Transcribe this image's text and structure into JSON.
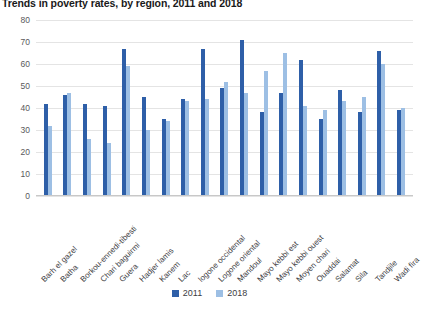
{
  "chart_data": {
    "type": "bar",
    "title": "Trends in poverty rates, by region, 2011 and 2018",
    "xlabel": "",
    "ylabel": "Percent",
    "ylim": [
      0,
      80
    ],
    "ytick_step": 10,
    "yticks": [
      "80",
      "70",
      "60",
      "50",
      "40",
      "30",
      "20",
      "10",
      "0"
    ],
    "grid": true,
    "legend_position": "bottom",
    "categories": [
      "Barh el gazel",
      "Batha",
      "Borkou-ennedi-tibesti",
      "Chari baguirmi",
      "Guera",
      "Hadjer lamis",
      "Kanem",
      "Lac",
      "logone occidental",
      "Logone oriental",
      "Mandoul",
      "Mayo kebbi est",
      "Mayo kebbi ouest",
      "Moyen chari",
      "Ouaddai",
      "Salamat",
      "Sila",
      "Tandjile",
      "Wadi fira"
    ],
    "series": [
      {
        "name": "2011",
        "color": "#2E5FA8",
        "values": [
          42,
          46,
          42,
          41,
          67,
          45,
          35,
          44,
          67,
          49,
          71,
          38,
          47,
          62,
          35,
          48,
          38,
          66,
          39
        ]
      },
      {
        "name": "2018",
        "color": "#9DBFE4",
        "values": [
          32,
          47,
          26,
          24,
          59,
          30,
          34,
          43,
          44,
          52,
          47,
          57,
          65,
          41,
          39,
          43,
          45,
          60,
          40
        ]
      }
    ]
  },
  "legend": {
    "items": [
      {
        "label": "2011"
      },
      {
        "label": "2018"
      }
    ]
  }
}
